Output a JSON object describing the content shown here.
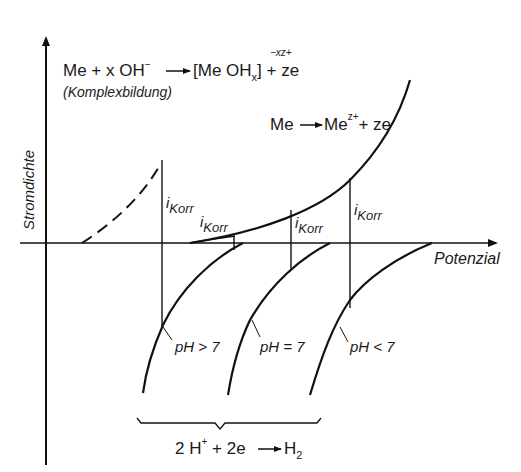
{
  "diagram": {
    "type": "current-density vs potential (corrosion polarization diagram)",
    "axes": {
      "y_label": "Stromdichte",
      "x_label": "Potenzial"
    },
    "reactions": {
      "complex_formation": {
        "equation_left": "Me + x OH",
        "oh_charge": "−",
        "arrow": "→",
        "equation_right_open": "[Me OH",
        "subscript": "x",
        "equation_right_close": "]",
        "charge": "−xz+",
        "tail": " + ze",
        "note": "(Komplexbildung)"
      },
      "anodic_dissolution": {
        "left": "Me",
        "arrow": "→",
        "right": "Me",
        "charge": "z+",
        "tail": "+ ze"
      },
      "hydrogen_evolution": {
        "left": "2 H",
        "charge": "+",
        "middle": " + 2e ",
        "arrow": "→",
        "right": "H",
        "subscript": "2"
      }
    },
    "corrosion_current_labels": [
      {
        "text": "i",
        "sub": "Korr"
      },
      {
        "text": "i",
        "sub": "Korr"
      },
      {
        "text": "i",
        "sub": "Korr"
      },
      {
        "text": "i",
        "sub": "Korr"
      }
    ],
    "cathodic_curves": [
      {
        "label": "pH > 7"
      },
      {
        "label": "pH = 7"
      },
      {
        "label": "pH < 7"
      }
    ],
    "colors": {
      "line": "#111111",
      "background": "#ffffff"
    }
  }
}
